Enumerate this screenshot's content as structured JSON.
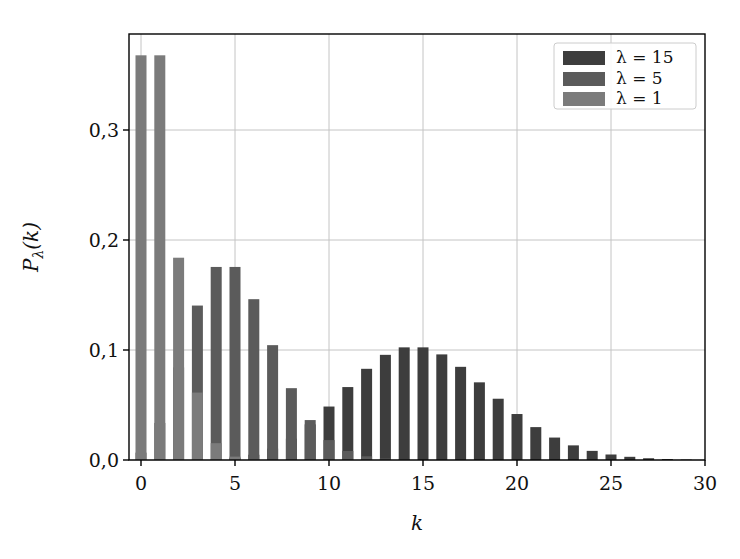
{
  "chart_data": {
    "type": "bar",
    "title": "",
    "xlabel": "k",
    "ylabel": "P_λ(k)",
    "xlim": [
      -0.6,
      30
    ],
    "ylim": [
      0,
      0.386
    ],
    "grid": true,
    "legend_position": "upper right",
    "x_ticks": [
      0,
      5,
      10,
      15,
      20,
      25,
      30
    ],
    "x_tick_labels": [
      "0",
      "5",
      "10",
      "15",
      "20",
      "25",
      "30"
    ],
    "y_ticks": [
      0.0,
      0.1,
      0.2,
      0.3
    ],
    "y_tick_labels": [
      "0,0",
      "0,1",
      "0,2",
      "0,3"
    ],
    "x": [
      0,
      1,
      2,
      3,
      4,
      5,
      6,
      7,
      8,
      9,
      10,
      11,
      12,
      13,
      14,
      15,
      16,
      17,
      18,
      19,
      20,
      21,
      22,
      23,
      24,
      25,
      26,
      27,
      28,
      29,
      30
    ],
    "series": [
      {
        "name": "λ = 15",
        "color": "#3d3d3d",
        "values": [
          0.0,
          0.0,
          0.0,
          0.0002,
          0.0006,
          0.0019,
          0.0048,
          0.0104,
          0.0194,
          0.0324,
          0.0486,
          0.0663,
          0.0829,
          0.0956,
          0.1024,
          0.1024,
          0.096,
          0.0847,
          0.0706,
          0.0557,
          0.0418,
          0.0299,
          0.0204,
          0.0133,
          0.0083,
          0.005,
          0.0029,
          0.0016,
          0.0009,
          0.0004,
          0.0002
        ]
      },
      {
        "name": "λ = 5",
        "color": "#5b5b5b",
        "values": [
          0.0067,
          0.0337,
          0.0842,
          0.1404,
          0.1755,
          0.1755,
          0.1462,
          0.1044,
          0.0653,
          0.0363,
          0.0181,
          0.0082,
          0.0034,
          0.0013,
          0.0005,
          0.0002,
          0.0,
          0.0,
          0.0,
          0.0,
          0.0,
          0.0,
          0.0,
          0.0,
          0.0,
          0.0,
          0.0,
          0.0,
          0.0,
          0.0,
          0.0
        ]
      },
      {
        "name": "λ = 1",
        "color": "#7b7b7b",
        "values": [
          0.3679,
          0.3679,
          0.1839,
          0.0613,
          0.0153,
          0.0031,
          0.0005,
          0.0001,
          0.0,
          0.0,
          0.0,
          0.0,
          0.0,
          0.0,
          0.0,
          0.0,
          0.0,
          0.0,
          0.0,
          0.0,
          0.0,
          0.0,
          0.0,
          0.0,
          0.0,
          0.0,
          0.0,
          0.0,
          0.0,
          0.0,
          0.0
        ]
      }
    ]
  },
  "legend": {
    "items": [
      {
        "label": "λ = 15",
        "color": "#3d3d3d"
      },
      {
        "label": "λ = 5",
        "color": "#5b5b5b"
      },
      {
        "label": "λ = 1",
        "color": "#7b7b7b"
      }
    ]
  },
  "axes": {
    "x_label": "k",
    "y_label_main": "P",
    "y_label_sub": "λ",
    "y_label_arg": "(k)"
  }
}
